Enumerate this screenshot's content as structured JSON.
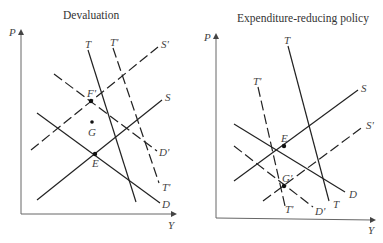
{
  "panels": [
    {
      "title": "Devaluation",
      "axes": {
        "y": "P",
        "x": "Y"
      },
      "curves": [
        {
          "id": "T",
          "style": "solid",
          "label": "T"
        },
        {
          "id": "T_prime",
          "style": "dashed",
          "label": "T'"
        },
        {
          "id": "S",
          "style": "solid",
          "label": "S"
        },
        {
          "id": "S_prime",
          "style": "dashed",
          "label": "S'"
        },
        {
          "id": "D",
          "style": "solid",
          "label": "D"
        },
        {
          "id": "D_prime",
          "style": "dashed",
          "label": "D'"
        }
      ],
      "points": [
        {
          "label": "F'"
        },
        {
          "label": "G"
        },
        {
          "label": "E"
        }
      ]
    },
    {
      "title": "Expenditure-reducing policy",
      "axes": {
        "y": "P",
        "x": "Y"
      },
      "curves": [
        {
          "id": "T",
          "style": "solid",
          "label": "T"
        },
        {
          "id": "T_prime",
          "style": "dashed",
          "label": "T'"
        },
        {
          "id": "S",
          "style": "solid",
          "label": "S"
        },
        {
          "id": "S_prime",
          "style": "dashed",
          "label": "S'"
        },
        {
          "id": "D",
          "style": "solid",
          "label": "D"
        },
        {
          "id": "D_prime",
          "style": "dashed",
          "label": "D'"
        }
      ],
      "points": [
        {
          "label": "E"
        },
        {
          "label": "G'"
        }
      ]
    }
  ]
}
